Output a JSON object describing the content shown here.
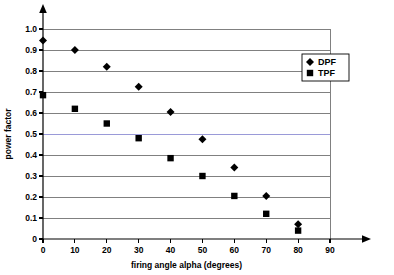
{
  "chart_data": {
    "type": "scatter",
    "title": "",
    "xlabel": "firing angle alpha (degrees)",
    "ylabel": "power factor",
    "xlim": [
      0,
      90
    ],
    "ylim": [
      0,
      1.0
    ],
    "grid": true,
    "legend_position": "top-right",
    "x": [
      0,
      10,
      20,
      30,
      40,
      50,
      60,
      70,
      80
    ],
    "xticks": [
      "0",
      "10",
      "20",
      "30",
      "40",
      "50",
      "60",
      "70",
      "80",
      "90"
    ],
    "yticks": [
      "0",
      "0.1",
      "0.2",
      "0.3",
      "0.4",
      "0.5",
      "0.6",
      "0.7",
      "0.8",
      "0.9",
      "1.0"
    ],
    "series": [
      {
        "name": "DPF",
        "marker": "diamond",
        "color": "#000000",
        "values": [
          0.945,
          0.9,
          0.82,
          0.725,
          0.605,
          0.475,
          0.34,
          0.205,
          0.07
        ]
      },
      {
        "name": "TPF",
        "marker": "square",
        "color": "#000000",
        "values": [
          0.685,
          0.62,
          0.55,
          0.48,
          0.385,
          0.3,
          0.205,
          0.12,
          0.04
        ]
      }
    ]
  },
  "legend": {
    "entries": [
      {
        "label": "DPF",
        "marker": "diamond"
      },
      {
        "label": "TPF",
        "marker": "square"
      }
    ]
  },
  "axes": {
    "x_title": "firing angle alpha (degrees)",
    "y_title": "power factor",
    "x_tick_labels": [
      "0",
      "10",
      "20",
      "30",
      "40",
      "50",
      "60",
      "70",
      "80",
      "90"
    ],
    "y_tick_labels": [
      "0",
      "0.1",
      "0.2",
      "0.3",
      "0.4",
      "0.5",
      "0.6",
      "0.7",
      "0.8",
      "0.9",
      "1.0"
    ]
  }
}
